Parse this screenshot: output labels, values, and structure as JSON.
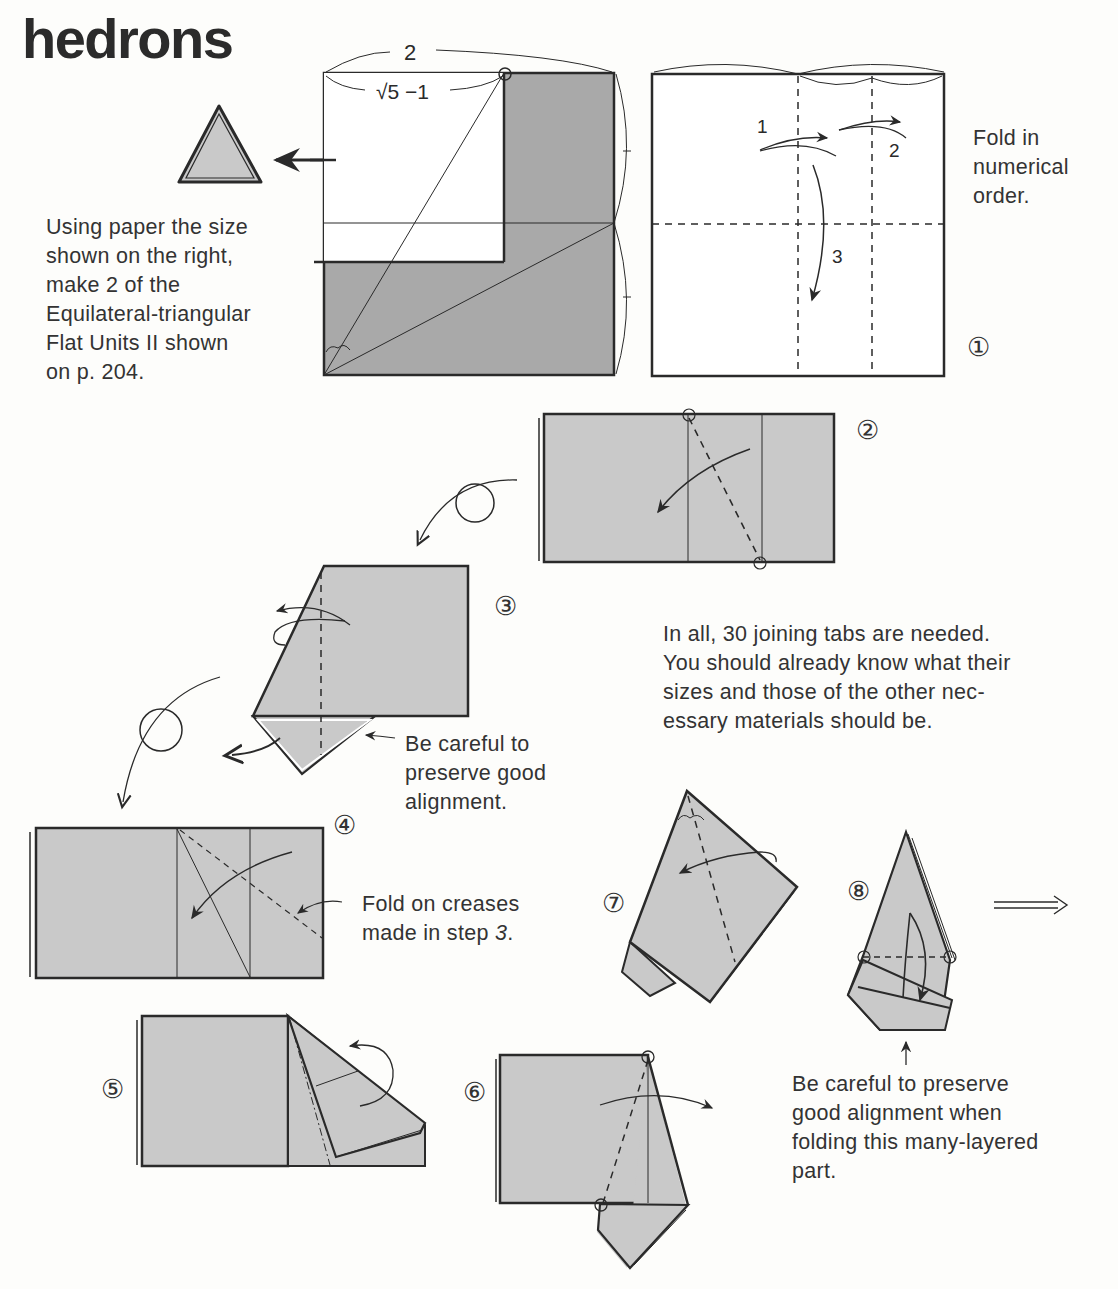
{
  "page": {
    "title": "hedrons"
  },
  "intro": {
    "lines": [
      "Using paper the size",
      "shown on the right,",
      "make 2 of the",
      "Equilateral-triangular",
      "Flat Units II shown",
      "on p. 204."
    ]
  },
  "paper_size_diagram": {
    "width_label": "2",
    "sub_label": "√5 −1"
  },
  "step1": {
    "number": "①",
    "fold_labels": [
      "1",
      "2",
      "3"
    ],
    "note_lines": [
      "Fold in",
      "numerical",
      "order."
    ]
  },
  "step2": {
    "number": "②"
  },
  "step3": {
    "number": "③",
    "note_lines": [
      "Be careful to",
      "preserve good",
      "alignment."
    ]
  },
  "tabs_note": {
    "lines": [
      "In all, 30 joining tabs are needed.",
      "You should already know what their",
      "sizes and those of the other nec-",
      "essary materials should be."
    ]
  },
  "step4": {
    "number": "④",
    "note_line1": "Fold on creases",
    "note_line2_prefix": "made in step ",
    "note_line2_ref": "3",
    "note_line2_suffix": "."
  },
  "step5": {
    "number": "⑤"
  },
  "step6": {
    "number": "⑥"
  },
  "step7": {
    "number": "⑦"
  },
  "step8": {
    "number": "⑧",
    "note_lines": [
      "Be careful to preserve",
      "good alignment when",
      "folding this many-layered",
      "part."
    ]
  },
  "colors": {
    "paper_gray": "#c9c9c9",
    "dark_gray": "#a9a9a9",
    "ink": "#2a2a2a",
    "background": "#fdfdfb"
  }
}
